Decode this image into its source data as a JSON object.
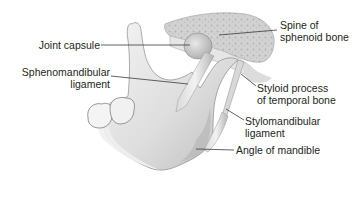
{
  "diagram": {
    "colors": {
      "bone_light": "#efefef",
      "bone_mid": "#cfcfcf",
      "bone_dark": "#8c8c8c",
      "leader_line": "#3a3a3a",
      "text": "#231f20"
    },
    "labels": {
      "joint_capsule": "Joint capsule",
      "sphenomandibular_line1": "Sphenomandibular",
      "sphenomandibular_line2": "ligament",
      "spine_line1": "Spine of",
      "spine_line2": "sphenoid bone",
      "styloid_line1": "Styloid process",
      "styloid_line2": "of temporal bone",
      "stylomandibular_line1": "Stylomandibular",
      "stylomandibular_line2": "ligament",
      "angle": "Angle of mandible"
    }
  }
}
